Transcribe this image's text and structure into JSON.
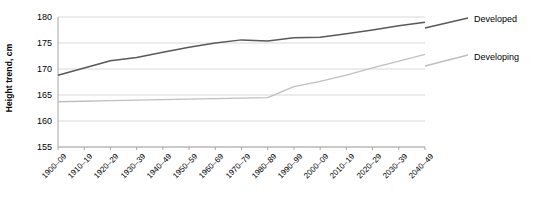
{
  "chart_data": {
    "type": "line",
    "title": "",
    "xlabel": "",
    "ylabel": "Height trend, cm",
    "ylim": [
      155,
      180
    ],
    "yticks": [
      155,
      160,
      165,
      170,
      175,
      180
    ],
    "grid": true,
    "legend_position": "right",
    "categories": [
      "1900–09",
      "1910–19",
      "1920–29",
      "1930–39",
      "1940–49",
      "1950–59",
      "1960–69",
      "1970–79",
      "1980–89",
      "1990–99",
      "2000–09",
      "2010–19",
      "2020–29",
      "2030–39",
      "2040–49"
    ],
    "series": [
      {
        "name": "Developed",
        "color": "#595959",
        "values": [
          168.8,
          170.2,
          171.6,
          172.2,
          173.2,
          174.2,
          175.0,
          175.6,
          175.4,
          176.0,
          176.1,
          176.8,
          177.5,
          178.3,
          179.0
        ]
      },
      {
        "name": "Developing",
        "color": "#bfbfbf",
        "values": [
          163.7,
          163.8,
          163.9,
          164.0,
          164.1,
          164.2,
          164.3,
          164.4,
          164.5,
          166.6,
          167.6,
          168.8,
          170.2,
          171.5,
          172.8
        ]
      }
    ]
  },
  "axis": {
    "y_title": "Height trend, cm",
    "y_tick_labels": [
      "180",
      "175",
      "170",
      "165",
      "160",
      "155"
    ],
    "x_tick_labels": [
      "1900–09",
      "1910–19",
      "1920–29",
      "1930–39",
      "1940–49",
      "1950–59",
      "1960–69",
      "1970–79",
      "1980–89",
      "1990–99",
      "2000–09",
      "2010–19",
      "2020–29",
      "2030–39",
      "2040–49"
    ]
  },
  "legend": {
    "entries": [
      {
        "label": "Developed",
        "color": "#595959"
      },
      {
        "label": "Developing",
        "color": "#bfbfbf"
      }
    ]
  },
  "colors": {
    "gridline": "#d9d9d9",
    "axis": "#a6a6a6",
    "developed": "#595959",
    "developing": "#bfbfbf",
    "text": "#000000",
    "background": "#ffffff"
  }
}
